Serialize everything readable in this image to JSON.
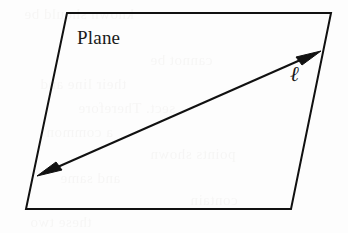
{
  "figure": {
    "kind": "geometry-diagram",
    "background_color": "#fdfdfd",
    "ink_color": "#111111",
    "canvas": {
      "width": 348,
      "height": 233
    }
  },
  "plane": {
    "label": "Plane",
    "label_position": {
      "x": 77,
      "y": 27
    },
    "stroke_color": "#111111",
    "stroke_width": 2,
    "fill": "none",
    "corners": {
      "top_left": {
        "x": 67,
        "y": 13
      },
      "top_right": {
        "x": 331,
        "y": 13
      },
      "bottom_right": {
        "x": 291,
        "y": 209
      },
      "bottom_left": {
        "x": 26,
        "y": 209
      }
    },
    "points_attr": "67,13 331,13 291,209 26,209"
  },
  "line": {
    "label": "ℓ",
    "label_name": "script-ell",
    "label_position": {
      "x": 290,
      "y": 63
    },
    "stroke_color": "#111111",
    "stroke_width": 2,
    "arrowheads": "both",
    "start_point": {
      "x": 37,
      "y": 176
    },
    "end_point": {
      "x": 321,
      "y": 51
    }
  },
  "ghost_text": {
    "note": "faint bleed-through from reverse of scanned page",
    "color": "#8a8075",
    "opacity": 0.055,
    "rows": [
      {
        "text": "known should be",
        "x": 24,
        "y": 6
      },
      {
        "text": "cannot be",
        "x": 150,
        "y": 52
      },
      {
        "text": "their line and",
        "x": 40,
        "y": 76
      },
      {
        "text": "sect. Therefore",
        "x": 78,
        "y": 100
      },
      {
        "text": "a common",
        "x": 46,
        "y": 124
      },
      {
        "text": "points shown",
        "x": 150,
        "y": 146
      },
      {
        "text": "and same",
        "x": 60,
        "y": 170
      },
      {
        "text": "contain",
        "x": 190,
        "y": 192
      },
      {
        "text": "these two",
        "x": 30,
        "y": 214
      }
    ]
  }
}
